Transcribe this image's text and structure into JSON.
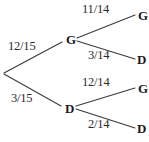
{
  "diagram": {
    "type": "probability-tree",
    "title": "",
    "stroke_color": "#3a3a3a",
    "text_color": "#1a1a1a",
    "background_color": "#ffffff",
    "root": {
      "label": "",
      "x": 3,
      "y": 73
    },
    "level1": [
      {
        "id": "g1",
        "node_label": "G",
        "edge_label": "12/15",
        "node_x": 69,
        "node_y": 39,
        "edge_label_x": 8,
        "edge_label_y": 40
      },
      {
        "id": "d1",
        "node_label": "D",
        "edge_label": "3/15",
        "node_x": 68,
        "node_y": 108,
        "edge_label_x": 11,
        "edge_label_y": 92
      }
    ],
    "level2": [
      {
        "id": "g1-g2",
        "parent": "g1",
        "node_label": "G",
        "edge_label": "11/14",
        "node_x": 138,
        "node_y": 11,
        "edge_label_x": 82,
        "edge_label_y": 3
      },
      {
        "id": "g1-d2",
        "parent": "g1",
        "node_label": "D",
        "edge_label": "3/14",
        "node_x": 138,
        "node_y": 55,
        "edge_label_x": 88,
        "edge_label_y": 49
      },
      {
        "id": "d1-g2",
        "parent": "d1",
        "node_label": "G",
        "edge_label": "12/14",
        "node_x": 138,
        "node_y": 84,
        "edge_label_x": 82,
        "edge_label_y": 76
      },
      {
        "id": "d1-d2",
        "parent": "d1",
        "node_label": "D",
        "edge_label": "2/14",
        "node_x": 138,
        "node_y": 124,
        "edge_label_x": 88,
        "edge_label_y": 118
      }
    ]
  }
}
